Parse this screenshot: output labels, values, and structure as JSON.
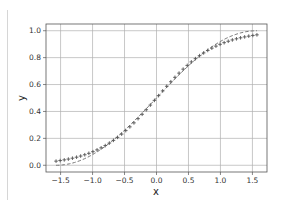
{
  "chart_data": {
    "type": "line",
    "title": "",
    "xlabel": "x",
    "ylabel": "y",
    "xlim": [
      -1.728,
      1.728
    ],
    "ylim": [
      -0.05,
      1.05
    ],
    "grid": true,
    "legend": null,
    "xticks": [
      -1.5,
      -1.0,
      -0.5,
      0.0,
      0.5,
      1.0,
      1.5
    ],
    "xtick_labels": [
      "−1.5",
      "−1.0",
      "−0.5",
      "0.0",
      "0.5",
      "1.0",
      "1.5"
    ],
    "yticks": [
      0.0,
      0.2,
      0.4,
      0.6,
      0.8,
      1.0
    ],
    "ytick_labels": [
      "0.0",
      "0.2",
      "0.4",
      "0.6",
      "0.8",
      "1.0"
    ],
    "series": [
      {
        "name": "true curve (dashed)",
        "style": "dashed",
        "color": "#777777",
        "function": "(sin(x)+1)/2",
        "x_range": [
          -1.5708,
          1.5708
        ],
        "y_endpoints": [
          0.0,
          1.0
        ]
      },
      {
        "name": "fitted points (+ markers)",
        "style": "markers",
        "marker": "+",
        "color": "#555555",
        "function": "1/(1+exp(-2.2*x))",
        "x_range": [
          -1.5708,
          1.5708
        ],
        "n_points": 50,
        "y_endpoints": [
          0.03,
          0.97
        ]
      }
    ]
  },
  "colors": {
    "grid": "#b0b0b0",
    "frame": "#555555",
    "separator": "#d6d6d6"
  }
}
